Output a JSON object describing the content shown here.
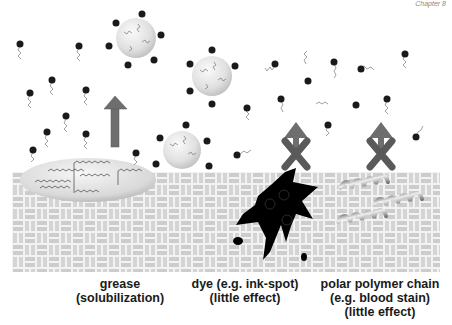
{
  "figure": {
    "corner_text": "Chapter 8",
    "labels": [
      {
        "id": "grease",
        "lines": [
          "grease",
          "(solubilization)"
        ]
      },
      {
        "id": "dye",
        "lines": [
          "dye (e.g. ink-spot)",
          "(little effect)"
        ]
      },
      {
        "id": "polymer",
        "lines": [
          "polar polymer chain",
          "(e.g. blood stain)",
          "(little effect)"
        ]
      }
    ],
    "colors": {
      "fabric": "#cfcfcf",
      "fabric_gap": "#f2f2f2",
      "surfactant_head": "#1a1a1a",
      "surfactant_tail": "#777777",
      "micelle": "#e6e6e6",
      "arrow": "#6e6e6e",
      "cross": "#5a5a5a",
      "ink": "#000000"
    }
  }
}
